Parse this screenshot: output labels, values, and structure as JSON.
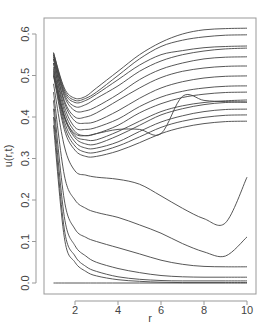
{
  "chart_data": {
    "type": "line",
    "title": "",
    "xlabel": "r",
    "ylabel": "u(r,t)",
    "xlim": [
      1,
      10
    ],
    "ylim": [
      -0.02,
      0.63
    ],
    "x_ticks": [
      2,
      4,
      6,
      8,
      10
    ],
    "x_tick_labels": [
      "2",
      "4",
      "6",
      "8",
      "10"
    ],
    "y_ticks": [
      0.0,
      0.1,
      0.2,
      0.3,
      0.4,
      0.5,
      0.6
    ],
    "y_tick_labels": [
      "0.0",
      "0.1",
      "0.2",
      "0.3",
      "0.4",
      "0.5",
      "0.6"
    ],
    "grid": false,
    "legend": null,
    "line_color": "#444444",
    "x": [
      1.0,
      1.5,
      2.0,
      2.5,
      3.0,
      4.0,
      5.0,
      6.0,
      7.0,
      8.0,
      9.0,
      10.0
    ],
    "series": [
      {
        "name": "t1",
        "values": [
          0.555,
          0.47,
          0.445,
          0.45,
          0.47,
          0.51,
          0.55,
          0.58,
          0.6,
          0.61,
          0.613,
          0.614
        ]
      },
      {
        "name": "t2",
        "values": [
          0.555,
          0.465,
          0.44,
          0.445,
          0.46,
          0.5,
          0.54,
          0.57,
          0.585,
          0.593,
          0.597,
          0.598
        ]
      },
      {
        "name": "t3",
        "values": [
          0.55,
          0.46,
          0.435,
          0.44,
          0.455,
          0.49,
          0.525,
          0.55,
          0.56,
          0.567,
          0.57,
          0.571
        ]
      },
      {
        "name": "t4",
        "values": [
          0.55,
          0.455,
          0.425,
          0.43,
          0.445,
          0.475,
          0.51,
          0.535,
          0.55,
          0.559,
          0.564,
          0.566
        ]
      },
      {
        "name": "t5",
        "values": [
          0.545,
          0.45,
          0.415,
          0.415,
          0.425,
          0.455,
          0.49,
          0.515,
          0.53,
          0.54,
          0.544,
          0.545
        ]
      },
      {
        "name": "t6",
        "values": [
          0.54,
          0.44,
          0.4,
          0.4,
          0.41,
          0.44,
          0.47,
          0.495,
          0.51,
          0.518,
          0.522,
          0.523
        ]
      },
      {
        "name": "t7",
        "values": [
          0.54,
          0.435,
          0.39,
          0.385,
          0.39,
          0.415,
          0.445,
          0.47,
          0.485,
          0.494,
          0.498,
          0.499
        ]
      },
      {
        "name": "t8",
        "values": [
          0.53,
          0.425,
          0.375,
          0.37,
          0.375,
          0.395,
          0.425,
          0.448,
          0.462,
          0.47,
          0.474,
          0.475
        ]
      },
      {
        "name": "t9",
        "values": [
          0.53,
          0.415,
          0.365,
          0.355,
          0.36,
          0.38,
          0.41,
          0.432,
          0.447,
          0.455,
          0.459,
          0.46
        ]
      },
      {
        "name": "t10",
        "values": [
          0.52,
          0.405,
          0.355,
          0.345,
          0.345,
          0.365,
          0.39,
          0.413,
          0.427,
          0.435,
          0.439,
          0.441
        ]
      },
      {
        "name": "t11",
        "values": [
          0.515,
          0.4,
          0.35,
          0.335,
          0.335,
          0.355,
          0.38,
          0.405,
          0.42,
          0.43,
          0.435,
          0.436
        ]
      },
      {
        "name": "t12",
        "values": [
          0.51,
          0.39,
          0.34,
          0.325,
          0.325,
          0.34,
          0.365,
          0.388,
          0.403,
          0.413,
          0.418,
          0.419
        ]
      },
      {
        "name": "t13",
        "values": [
          0.505,
          0.38,
          0.33,
          0.315,
          0.315,
          0.33,
          0.352,
          0.375,
          0.39,
          0.399,
          0.404,
          0.405
        ]
      },
      {
        "name": "t14",
        "values": [
          0.5,
          0.37,
          0.32,
          0.305,
          0.305,
          0.318,
          0.338,
          0.36,
          0.375,
          0.384,
          0.389,
          0.39
        ]
      },
      {
        "name": "t15",
        "values": [
          0.5,
          0.4,
          0.36,
          0.355,
          0.36,
          0.37,
          0.37,
          0.36,
          0.45,
          0.44,
          0.437,
          0.436
        ]
      },
      {
        "name": "t16",
        "values": [
          0.48,
          0.33,
          0.27,
          0.26,
          0.255,
          0.25,
          0.238,
          0.21,
          0.18,
          0.155,
          0.145,
          0.255
        ]
      },
      {
        "name": "t17",
        "values": [
          0.46,
          0.26,
          0.2,
          0.18,
          0.17,
          0.158,
          0.14,
          0.12,
          0.095,
          0.075,
          0.065,
          0.111
        ]
      },
      {
        "name": "t18",
        "values": [
          0.44,
          0.2,
          0.13,
          0.11,
          0.1,
          0.085,
          0.07,
          0.055,
          0.045,
          0.04,
          0.039,
          0.039
        ]
      },
      {
        "name": "t19",
        "values": [
          0.42,
          0.16,
          0.09,
          0.065,
          0.05,
          0.035,
          0.025,
          0.018,
          0.015,
          0.014,
          0.014,
          0.014
        ]
      },
      {
        "name": "t20",
        "values": [
          0.4,
          0.13,
          0.065,
          0.04,
          0.028,
          0.015,
          0.009,
          0.006,
          0.005,
          0.005,
          0.005,
          0.005
        ]
      },
      {
        "name": "t21",
        "values": [
          0.38,
          0.11,
          0.05,
          0.028,
          0.017,
          0.008,
          0.004,
          0.002,
          0.001,
          0.001,
          0.001,
          0.001
        ]
      },
      {
        "name": "t22",
        "values": [
          0.0,
          0.0,
          0.0,
          0.0,
          0.0,
          0.0,
          0.0,
          0.0,
          0.0,
          0.0,
          0.0,
          0.0
        ]
      }
    ]
  }
}
